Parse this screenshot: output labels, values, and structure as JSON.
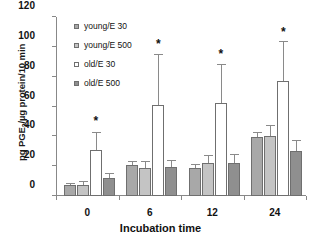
{
  "chart_data": {
    "type": "bar",
    "title": "",
    "xlabel": "Incubation time",
    "ylabel": "pg PGE2/µg protein/10 min",
    "ylabel_parts": {
      "pre": "pg PGE",
      "sub": "2",
      "post": "/µg protein/10 min"
    },
    "categories": [
      "0",
      "6",
      "12",
      "24"
    ],
    "ylim": [
      0,
      120
    ],
    "yticks": [
      0,
      20,
      40,
      60,
      80,
      100,
      120
    ],
    "ytick_labels": [
      "0",
      "20",
      "40",
      "60",
      "80",
      "100",
      "120"
    ],
    "grid": false,
    "legend_position": "top-left",
    "series": [
      {
        "name": "young/E 30",
        "color": "#a8a8a8",
        "values": [
          7.5,
          20.5,
          19.0,
          39.5
        ],
        "errors": [
          0.8,
          2.0,
          1.5,
          3.0
        ]
      },
      {
        "name": "young/E 500",
        "color": "#c4c4c4",
        "values": [
          7.5,
          18.8,
          22.0,
          40.3
        ],
        "errors": [
          1.8,
          4.0,
          5.0,
          6.5
        ]
      },
      {
        "name": "old/E 30",
        "color": "#ffffff",
        "values": [
          31.0,
          60.8,
          62.3,
          77.0
        ],
        "errors": [
          11.5,
          34.0,
          25.5,
          26.0
        ],
        "significance": [
          "*",
          "*",
          "*",
          "*"
        ]
      },
      {
        "name": "old/E 500",
        "color": "#8f8f8f",
        "values": [
          12.0,
          19.5,
          22.0,
          30.2
        ],
        "errors": [
          2.5,
          4.0,
          5.5,
          7.0
        ]
      }
    ],
    "annotations": [
      {
        "label": "*",
        "category": "0",
        "series": "old/E 30",
        "y": 46
      },
      {
        "label": "*",
        "category": "6",
        "series": "old/E 30",
        "y": 98
      },
      {
        "label": "*",
        "category": "12",
        "series": "old/E 30",
        "y": 91
      },
      {
        "label": "*",
        "category": "24",
        "series": "old/E 30",
        "y": 106
      }
    ]
  }
}
